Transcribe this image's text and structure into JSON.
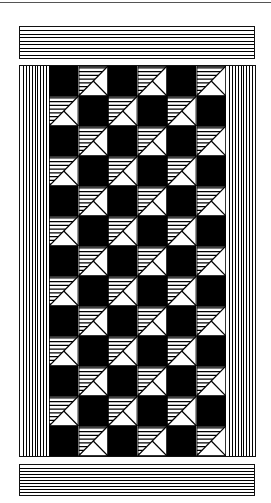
{
  "pattern": {
    "description": "Checkerboard of black squares alternating with tiles split diagonally: upper-left triangle horizontally hatched, lower-right triangle divided by a line from center to bottom-right corner",
    "columns": 6,
    "rows": 13,
    "first_cell": "black",
    "colors": {
      "ink": "#000000",
      "paper": "#ffffff"
    },
    "borders": {
      "top_bar_lines": 8,
      "bottom_bar_lines": 9,
      "left_bar_lines": 9,
      "right_bar_lines": 9
    }
  }
}
